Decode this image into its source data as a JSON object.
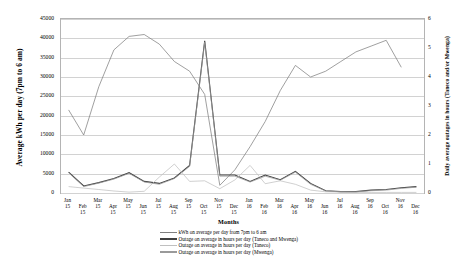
{
  "chart_data": {
    "type": "line",
    "title": "",
    "xlabel": "Months",
    "ylabel": "Average kWh per day (7pm to 6 am)",
    "y2label": "Daily average outages in hours (Taneco and/or Mwenga)",
    "grid": true,
    "legend_position": "bottom",
    "ylim": [
      0,
      45000
    ],
    "y2lim": [
      0,
      6
    ],
    "yticks": [
      "0",
      "5000",
      "10000",
      "15000",
      "20000",
      "25000",
      "30000",
      "35000",
      "40000",
      "45000"
    ],
    "y2ticks": [
      "0",
      "1",
      "2",
      "3",
      "4",
      "5",
      "6"
    ],
    "categories": [
      "Jan 15",
      "Feb 15",
      "Mar 15",
      "Apr 15",
      "May 15",
      "Jun 15",
      "Jul 15",
      "Aug 15",
      "Sep 15",
      "Oct 15",
      "Nov 15",
      "Dec 15",
      "Jan 16",
      "Feb 16",
      "Mar 16",
      "Apr 16",
      "May 16",
      "Jun 16",
      "Jul 16",
      "Aug 16",
      "Sep 16",
      "Oct 16",
      "Nov 16",
      "Dec 16"
    ],
    "series": [
      {
        "name": "kWh on average per day from 7pm to 6 am",
        "axis": "left",
        "color": "#808080",
        "values": [
          21500,
          15000,
          27500,
          37000,
          40500,
          41000,
          38500,
          34000,
          31500,
          25500,
          2000,
          6000,
          12000,
          18500,
          26500,
          33000,
          30000,
          31500,
          34000,
          36500,
          38000,
          39500,
          32500,
          null
        ]
      },
      {
        "name": "Outage on average in hours per day (Taneco and Mwenga)",
        "axis": "right",
        "color": "#404040",
        "values": [
          0.72,
          0.24,
          0.36,
          0.5,
          0.7,
          0.4,
          0.33,
          0.52,
          0.95,
          5.25,
          0.62,
          0.62,
          0.4,
          0.62,
          0.46,
          0.75,
          0.33,
          0.08,
          0.05,
          0.05,
          0.1,
          0.12,
          0.18,
          0.22
        ]
      },
      {
        "name": "Outage on average in hours per day (Taneco)",
        "axis": "right",
        "color": "#c0c0c0",
        "values": [
          0.22,
          0.17,
          0.12,
          0.07,
          0.03,
          0.06,
          0.55,
          1.0,
          0.4,
          0.42,
          0.15,
          0.45,
          0.95,
          0.32,
          0.42,
          0.3,
          0.1,
          0.04,
          0.03,
          0.02,
          0.02,
          0.02,
          0.02,
          0.02
        ]
      },
      {
        "name": "Outage on average in hours per day (Mwenga)",
        "axis": "right",
        "color": "#9a9a9a",
        "values": [
          0.7,
          0.22,
          0.34,
          0.48,
          0.68,
          0.38,
          0.3,
          0.5,
          0.92,
          5.2,
          0.58,
          0.58,
          0.38,
          0.58,
          0.44,
          0.72,
          0.3,
          0.07,
          0.04,
          0.04,
          0.08,
          0.1,
          0.16,
          0.2
        ]
      }
    ]
  }
}
